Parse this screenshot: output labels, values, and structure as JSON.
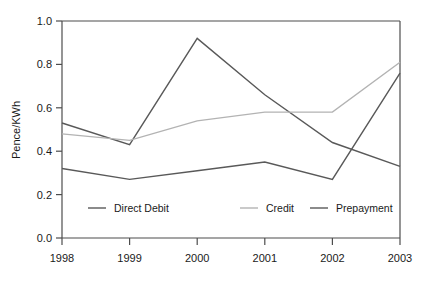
{
  "chart_data": {
    "type": "line",
    "title": "",
    "xlabel": "",
    "ylabel": "Pence/KWh",
    "categories": [
      "1998",
      "1999",
      "2000",
      "2001",
      "2002",
      "2003"
    ],
    "x": [
      1998,
      1999,
      2000,
      2001,
      2002,
      2003
    ],
    "xlim": [
      1998,
      2003
    ],
    "ylim": [
      0.0,
      1.0
    ],
    "yticks": [
      "0.0",
      "0.2",
      "0.4",
      "0.6",
      "0.8",
      "1.0"
    ],
    "ytick_values": [
      0.0,
      0.2,
      0.4,
      0.6,
      0.8,
      1.0
    ],
    "grid": false,
    "legend_position": "inside-bottom",
    "series": [
      {
        "name": "Direct Debit",
        "color": "#595959",
        "values": [
          0.53,
          0.43,
          0.92,
          0.66,
          0.44,
          0.33
        ]
      },
      {
        "name": "Credit",
        "color": "#b3b3b3",
        "values": [
          0.48,
          0.45,
          0.54,
          0.58,
          0.58,
          0.81
        ]
      },
      {
        "name": "Prepayment",
        "color": "#595959",
        "values": [
          0.32,
          0.27,
          0.31,
          0.35,
          0.27,
          0.76
        ]
      }
    ]
  },
  "legend": {
    "items": [
      {
        "label": "Direct Debit",
        "color": "#595959"
      },
      {
        "label": "Credit",
        "color": "#b3b3b3"
      },
      {
        "label": "Prepayment",
        "color": "#595959"
      }
    ]
  },
  "axes": {
    "y_title": "Pence/KWh",
    "y_labels": [
      "1.0",
      "0.8",
      "0.6",
      "0.4",
      "0.2",
      "0.0"
    ],
    "x_labels": [
      "1998",
      "1999",
      "2000",
      "2001",
      "2002",
      "2003"
    ]
  }
}
